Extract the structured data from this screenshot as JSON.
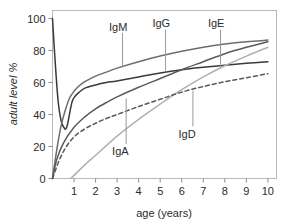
{
  "chart_data": {
    "type": "line",
    "title": "",
    "xlabel": "age (years)",
    "ylabel": "adult level %",
    "xlim": [
      0,
      10.4
    ],
    "ylim": [
      0,
      105
    ],
    "xticks": [
      1,
      2,
      3,
      4,
      5,
      6,
      7,
      8,
      9,
      10
    ],
    "xtick_labels": [
      "1",
      "2",
      "3",
      "4",
      "5",
      "6",
      "7",
      "8",
      "9",
      "10"
    ],
    "yticks": [
      0,
      20,
      40,
      60,
      80,
      100
    ],
    "ytick_labels": [
      "0",
      "20",
      "40",
      "60",
      "80",
      "100"
    ],
    "grid": false,
    "legend_position": "inline-annotations",
    "series": [
      {
        "name": "IgG",
        "label": "IgG",
        "color": "#3a3a3a",
        "dash": "solid",
        "x": [
          0.0,
          0.1,
          0.25,
          0.4,
          0.55,
          0.62,
          0.7,
          0.8,
          0.9,
          1.0,
          1.2,
          1.5,
          2.0,
          2.5,
          3.0,
          4.0,
          5.0,
          6.0,
          7.0,
          8.0,
          9.0,
          10.0
        ],
        "values": [
          100.0,
          78.0,
          50.0,
          36.0,
          31.5,
          31.0,
          34.0,
          41.0,
          47.5,
          50.5,
          53.5,
          56.5,
          58.5,
          60.0,
          61.0,
          63.5,
          66.0,
          68.0,
          69.5,
          70.8,
          72.0,
          73.0
        ]
      },
      {
        "name": "IgM",
        "label": "IgM",
        "color": "#6d6d6d",
        "dash": "solid",
        "x": [
          0.0,
          0.2,
          0.4,
          0.6,
          0.8,
          1.0,
          1.2,
          1.5,
          2.0,
          2.5,
          3.0,
          4.0,
          5.0,
          6.0,
          7.0,
          8.0,
          9.0,
          10.0
        ],
        "values": [
          0.0,
          18.0,
          33.0,
          43.0,
          50.5,
          54.5,
          57.5,
          60.5,
          64.0,
          66.5,
          69.0,
          73.0,
          76.5,
          79.5,
          82.0,
          84.0,
          85.5,
          86.5
        ]
      },
      {
        "name": "IgA",
        "label": "IgA",
        "color": "#5a5a5a",
        "dash": "solid",
        "x": [
          0.0,
          0.2,
          0.5,
          1.0,
          1.5,
          2.0,
          2.5,
          3.0,
          4.0,
          5.0,
          6.0,
          7.0,
          8.0,
          9.0,
          10.0
        ],
        "values": [
          0.0,
          12.0,
          22.0,
          32.0,
          38.5,
          43.5,
          47.5,
          51.0,
          57.0,
          62.5,
          68.0,
          73.0,
          78.0,
          82.0,
          85.5
        ]
      },
      {
        "name": "IgE",
        "label": "IgE",
        "color": "#b0b0b0",
        "dash": "solid",
        "x": [
          0.85,
          1.5,
          2.0,
          3.0,
          4.0,
          5.0,
          6.0,
          7.0,
          8.0,
          9.0,
          10.0
        ],
        "values": [
          0.0,
          8.5,
          14.5,
          26.5,
          37.0,
          46.5,
          55.5,
          63.5,
          70.5,
          76.5,
          82.0
        ]
      },
      {
        "name": "IgD",
        "label": "IgD",
        "color": "#5a5a5a",
        "dash": "dashed",
        "x": [
          0.0,
          0.3,
          0.6,
          1.0,
          1.5,
          2.0,
          2.5,
          3.0,
          4.0,
          5.0,
          6.0,
          7.0,
          8.0,
          9.0,
          10.0
        ],
        "values": [
          0.0,
          11.0,
          19.0,
          26.0,
          31.0,
          34.5,
          37.5,
          40.0,
          45.0,
          49.5,
          54.0,
          57.5,
          60.5,
          63.0,
          65.5
        ]
      }
    ],
    "annotations": [
      {
        "text": "IgM",
        "series": "IgM",
        "label_x": 3.05,
        "label_y": 95.0,
        "leader_from_x": 3.25,
        "leader_from_y": 91.0,
        "leader_to_x": 3.25,
        "leader_to_y": 69.5
      },
      {
        "text": "IgG",
        "series": "IgG",
        "label_x": 5.05,
        "label_y": 97.0,
        "leader_from_x": 5.25,
        "leader_from_y": 93.0,
        "leader_to_x": 5.25,
        "leader_to_y": 67.0
      },
      {
        "text": "IgE",
        "series": "IgE",
        "label_x": 7.6,
        "label_y": 97.0,
        "leader_from_x": 7.8,
        "leader_from_y": 93.0,
        "leader_to_x": 7.8,
        "leader_to_y": 70.0
      },
      {
        "text": "IgA",
        "series": "IgA",
        "label_x": 3.15,
        "label_y": 17.0,
        "leader_from_x": 3.42,
        "leader_from_y": 21.5,
        "leader_to_x": 3.42,
        "leader_to_y": 50.0
      },
      {
        "text": "IgD",
        "series": "IgD",
        "label_x": 6.25,
        "label_y": 28.0,
        "leader_from_x": 6.52,
        "leader_from_y": 32.5,
        "leader_to_x": 6.52,
        "leader_to_y": 55.0
      }
    ]
  },
  "figure": {
    "background_color": "#ffffff",
    "frame_color": "#b9b9b9",
    "tick_color": "#8d8d8d",
    "text_color": "#2b2b2b",
    "leader_color": "#9a9a9a"
  }
}
